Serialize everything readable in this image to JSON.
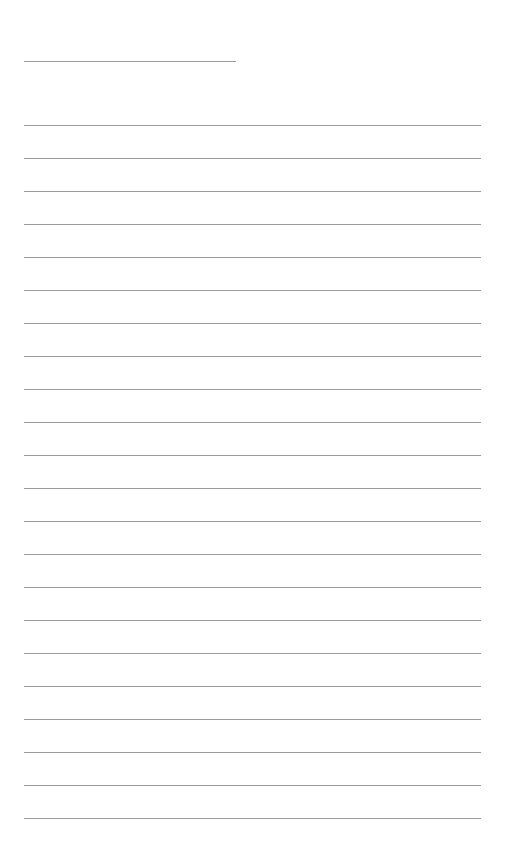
{
  "page": {
    "type": "lined-paper",
    "background": "#ffffff",
    "line_color": "#9a9a9a",
    "title_line": {
      "top": 61,
      "left": 24,
      "width": 212
    },
    "rules": {
      "count": 22,
      "first_top": 125,
      "spacing": 33,
      "left": 24,
      "width": 457
    }
  }
}
